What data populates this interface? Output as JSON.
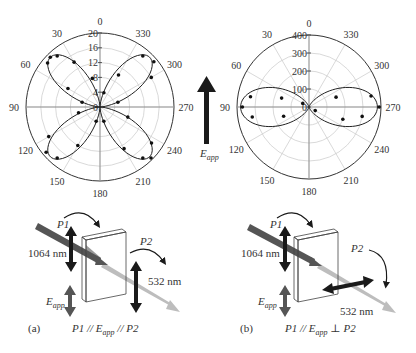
{
  "chart_data": [
    {
      "type": "polar",
      "panel": "left",
      "title": "",
      "angle_ticks": [
        "0",
        "30",
        "60",
        "90",
        "120",
        "150",
        "180",
        "210",
        "240",
        "270",
        "300",
        "330"
      ],
      "radial_ticks": [
        "0",
        "4",
        "8",
        "12",
        "16",
        "20"
      ],
      "rlim": [
        0,
        20
      ],
      "grid": true,
      "angle_direction": "counterclockwise from top",
      "series": [
        {
          "name": "fit",
          "shape": "four-lobe (cos^2 2θ-like)",
          "lobe_angles_deg": [
            45,
            135,
            225,
            315
          ],
          "peak": 19
        },
        {
          "name": "data",
          "points": [
            {
              "theta": 30,
              "r": 14
            },
            {
              "theta": 40,
              "r": 18
            },
            {
              "theta": 45,
              "r": 19
            },
            {
              "theta": 50,
              "r": 18.5
            },
            {
              "theta": 60,
              "r": 10
            },
            {
              "theta": 75,
              "r": 5
            },
            {
              "theta": 15,
              "r": 8
            },
            {
              "theta": 120,
              "r": 16
            },
            {
              "theta": 130,
              "r": 19
            },
            {
              "theta": 140,
              "r": 18
            },
            {
              "theta": 150,
              "r": 12
            },
            {
              "theta": 105,
              "r": 6
            },
            {
              "theta": 165,
              "r": 4
            },
            {
              "theta": 210,
              "r": 13
            },
            {
              "theta": 220,
              "r": 18
            },
            {
              "theta": 225,
              "r": 19.5
            },
            {
              "theta": 235,
              "r": 17
            },
            {
              "theta": 250,
              "r": 8
            },
            {
              "theta": 195,
              "r": 4
            },
            {
              "theta": 300,
              "r": 16
            },
            {
              "theta": 310,
              "r": 19
            },
            {
              "theta": 320,
              "r": 18
            },
            {
              "theta": 330,
              "r": 10
            },
            {
              "theta": 285,
              "r": 5
            },
            {
              "theta": 345,
              "r": 4
            }
          ]
        }
      ]
    },
    {
      "type": "polar",
      "panel": "right",
      "title": "",
      "angle_ticks": [
        "0",
        "30",
        "60",
        "90",
        "120",
        "150",
        "180",
        "210",
        "240",
        "270",
        "300",
        "330"
      ],
      "radial_ticks": [
        "0",
        "100",
        "200",
        "300",
        "400"
      ],
      "rlim": [
        0,
        400
      ],
      "grid": true,
      "series": [
        {
          "name": "fit",
          "shape": "two-lobe (cos^4 along 90/270)",
          "lobe_angles_deg": [
            90,
            270
          ],
          "peak": 380
        },
        {
          "name": "data",
          "points": [
            {
              "theta": 80,
              "r": 330
            },
            {
              "theta": 90,
              "r": 370
            },
            {
              "theta": 100,
              "r": 320
            },
            {
              "theta": 72,
              "r": 160
            },
            {
              "theta": 110,
              "r": 150
            },
            {
              "theta": 60,
              "r": 40
            },
            {
              "theta": 260,
              "r": 300
            },
            {
              "theta": 270,
              "r": 390
            },
            {
              "theta": 280,
              "r": 350
            },
            {
              "theta": 250,
              "r": 200
            },
            {
              "theta": 290,
              "r": 160
            },
            {
              "theta": 240,
              "r": 40
            }
          ]
        }
      ]
    }
  ],
  "center_arrow": {
    "label_main": "E",
    "label_sub": "app"
  },
  "panel_a": {
    "id_label": "(a)",
    "p1_label": "P1",
    "p2_label": "P2",
    "wavelength_in": "1064 nm",
    "wavelength_out": "532 nm",
    "eapp_main": "E",
    "eapp_sub": "app",
    "relation_p1": "P1 // ",
    "relation_e": "E",
    "relation_sub": "app",
    "relation_p2": " // P2"
  },
  "panel_b": {
    "id_label": "(b)",
    "p1_label": "P1",
    "p2_label": "P2",
    "wavelength_in": "1064 nm",
    "wavelength_out": "532 nm",
    "eapp_main": "E",
    "eapp_sub": "app",
    "relation_p1": "P1 // ",
    "relation_e": "E",
    "relation_sub": "app",
    "relation_p2": " ⊥ P2"
  },
  "colors": {
    "ink": "#1a1a1a",
    "grid": "#c8c8c8",
    "beam_ir": "#555555",
    "beam_green": "#b8b8b8",
    "pol_arrow": "#222222",
    "eapp_arrow": "#555555"
  }
}
